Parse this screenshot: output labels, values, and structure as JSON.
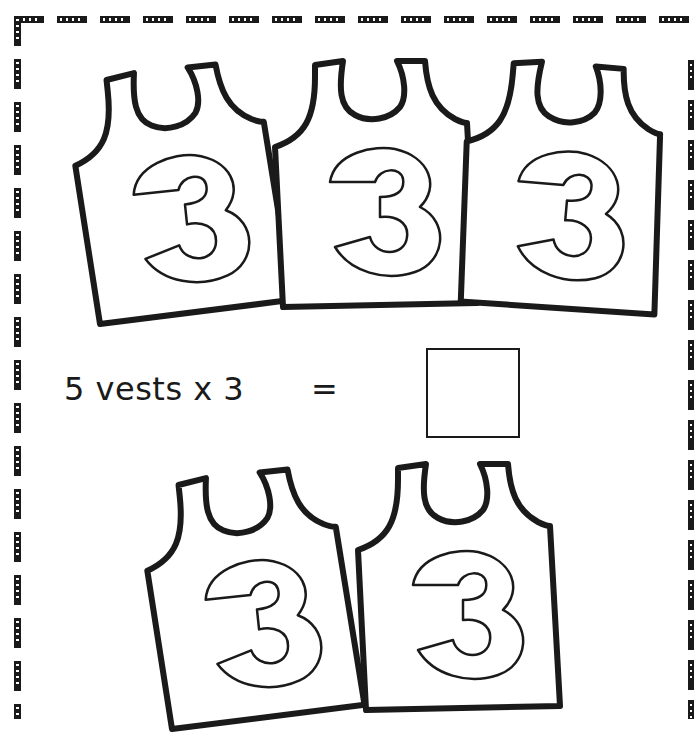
{
  "worksheet": {
    "equation": {
      "text": "5 vests x 3",
      "equals": "=",
      "answer": ""
    },
    "vests": [
      {
        "number": "3"
      },
      {
        "number": "3"
      },
      {
        "number": "3"
      },
      {
        "number": "3"
      },
      {
        "number": "3"
      }
    ],
    "colors": {
      "ink": "#1a1a1a",
      "paper": "#ffffff"
    }
  }
}
